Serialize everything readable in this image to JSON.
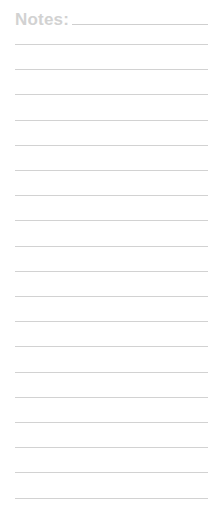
{
  "notepad": {
    "title": "Notes:",
    "line_color": "#d2d2d2",
    "title_color": "#d2d2d2",
    "ruled_line_count": 19,
    "first_line_y": 44,
    "line_spacing": 25.2
  }
}
